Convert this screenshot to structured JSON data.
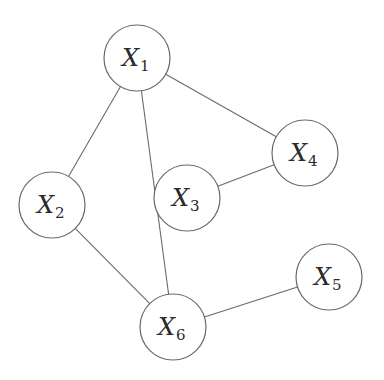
{
  "diagram": {
    "type": "undirected-graph",
    "colors": {
      "stroke": "#6a6a6a",
      "text": "#2a2a2a",
      "background": "#ffffff"
    },
    "node_radius": 33,
    "nodes": [
      {
        "id": "X1",
        "base": "X",
        "sub": "1",
        "x": 137,
        "y": 58
      },
      {
        "id": "X2",
        "base": "X",
        "sub": "2",
        "x": 52,
        "y": 205
      },
      {
        "id": "X3",
        "base": "X",
        "sub": "3",
        "x": 187,
        "y": 198
      },
      {
        "id": "X4",
        "base": "X",
        "sub": "4",
        "x": 305,
        "y": 153
      },
      {
        "id": "X5",
        "base": "X",
        "sub": "5",
        "x": 329,
        "y": 277
      },
      {
        "id": "X6",
        "base": "X",
        "sub": "6",
        "x": 173,
        "y": 327
      }
    ],
    "edges": [
      {
        "from": "X1",
        "to": "X2"
      },
      {
        "from": "X1",
        "to": "X4"
      },
      {
        "from": "X1",
        "to": "X6"
      },
      {
        "from": "X2",
        "to": "X6"
      },
      {
        "from": "X3",
        "to": "X4"
      },
      {
        "from": "X6",
        "to": "X5"
      }
    ]
  }
}
